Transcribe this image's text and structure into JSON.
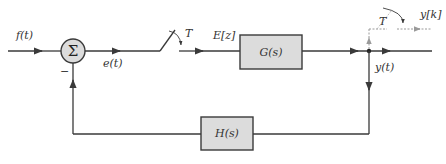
{
  "diagram": {
    "type": "block-diagram",
    "signals": {
      "input": "f(t)",
      "error": "e(t)",
      "sampled_error": "E[z]",
      "output": "y(t)",
      "sampled_output": "y[k]"
    },
    "summing_junction": {
      "symbol": "Σ",
      "feedback_sign": "−"
    },
    "samplers": [
      {
        "label": "T",
        "position": "error-path"
      },
      {
        "label": "T",
        "position": "output-path"
      }
    ],
    "blocks": {
      "forward": "G(s)",
      "feedback": "H(s)"
    },
    "colors": {
      "line": "#3a3a3a",
      "block_fill": "#dcdcdc",
      "dashed": "#9a9a9a",
      "text": "#333333"
    }
  }
}
